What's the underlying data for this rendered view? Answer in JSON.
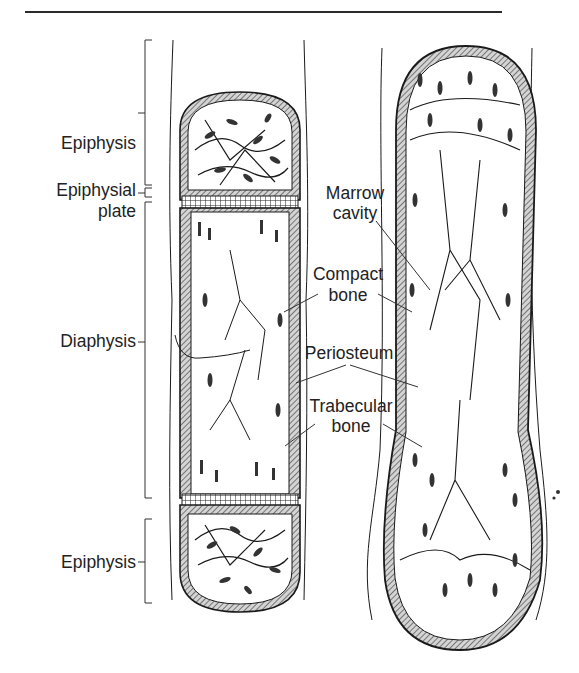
{
  "figure": {
    "type": "anatomical illustration"
  },
  "labels": {
    "epiphysis_top": "Epiphysis",
    "epiphysial_plate_line1": "Epiphysial",
    "epiphysial_plate_line2": "plate",
    "diaphysis": "Diaphysis",
    "epiphysis_bottom": "Epiphysis",
    "marrow_cavity_line1": "Marrow",
    "marrow_cavity_line2": "cavity",
    "compact_bone_line1": "Compact",
    "compact_bone_line2": "bone",
    "periosteum": "Periosteum",
    "trabecular_bone_line1": "Trabecular",
    "trabecular_bone_line2": "bone"
  },
  "colors": {
    "ink": "#1a1a1a",
    "cortex_fill": "#c8c8c8",
    "background": "#ffffff"
  }
}
